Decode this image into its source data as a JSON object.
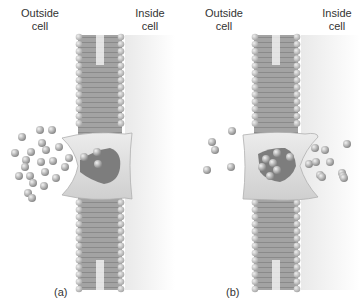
{
  "panels": [
    {
      "id": "a",
      "caption": "(a)",
      "outside_label": [
        "Outside",
        "cell"
      ],
      "inside_label": [
        "Inside",
        "cell"
      ],
      "state": "binding site open to outside; molecules entering carrier protein"
    },
    {
      "id": "b",
      "caption": "(b)",
      "outside_label": [
        "Outside",
        "cell"
      ],
      "inside_label": [
        "Inside",
        "cell"
      ],
      "state": "binding site open to inside; molecules released into cell"
    }
  ],
  "colors": {
    "membrane": "#9a9a9a",
    "head": "#c8c8c8",
    "protein": "#dedede",
    "pocket": "#7a7a7a",
    "molecule": "#b8b8b8",
    "text": "#333333"
  }
}
